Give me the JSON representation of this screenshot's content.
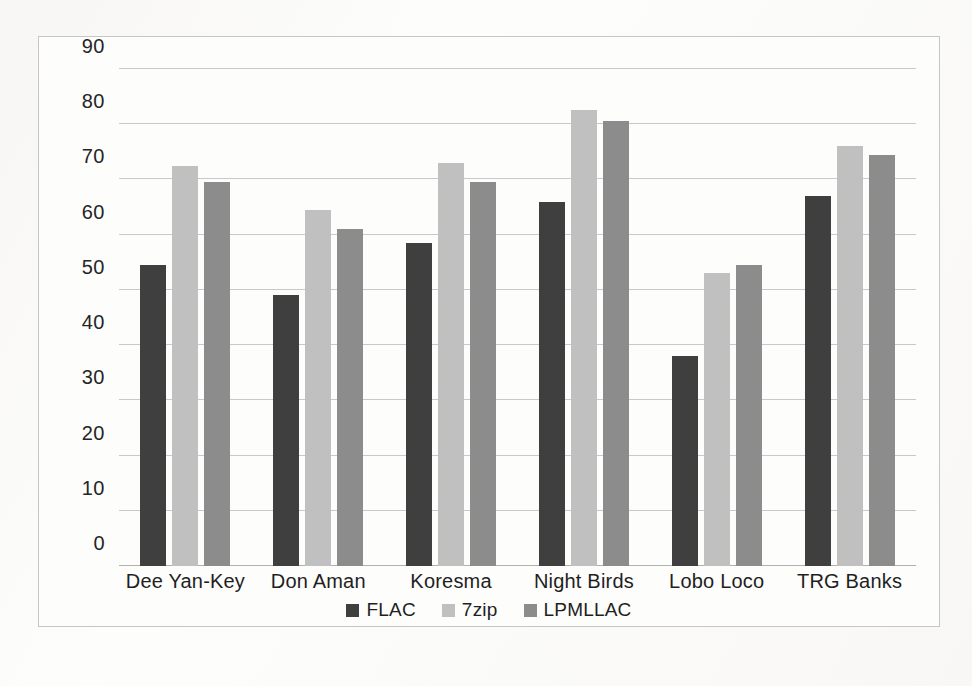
{
  "chart_data": {
    "type": "bar",
    "title": "",
    "xlabel": "",
    "ylabel": "",
    "ylim": [
      0,
      90
    ],
    "ytick_step": 10,
    "yticks": [
      90,
      80,
      70,
      60,
      50,
      40,
      30,
      20,
      10,
      0
    ],
    "grid": true,
    "legend_position": "bottom",
    "categories": [
      "Dee Yan-Key",
      "Don Aman",
      "Koresma",
      "Night Birds",
      "Lobo Loco",
      "TRG Banks"
    ],
    "series": [
      {
        "name": "FLAC",
        "color": "#3f3f3f",
        "values": [
          54.5,
          49,
          58.5,
          66,
          38,
          67
        ]
      },
      {
        "name": "7zip",
        "color": "#c0c0c0",
        "values": [
          72.5,
          64.5,
          73,
          82.5,
          53,
          76
        ]
      },
      {
        "name": "LPMLLAC",
        "color": "#8c8c8c",
        "values": [
          69.5,
          61,
          69.5,
          80.5,
          54.5,
          74.5
        ]
      }
    ]
  },
  "colors": {
    "flac": "#3f3f3f",
    "sevenzip": "#c0c0c0",
    "lpmllac": "#8c8c8c",
    "gridline": "#c9c9c9",
    "frame": "#c6c6c6",
    "background": "#fdfdfc"
  }
}
